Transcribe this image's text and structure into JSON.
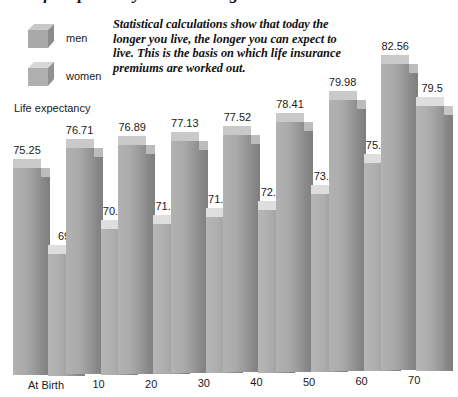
{
  "title": "Life expectancy at various ages",
  "caption": "Statistical calculations show that today the longer you live, the longer you can expect to live. This is the basis on which life insurance premiums are worked out.",
  "legend": {
    "items": [
      {
        "label": "men",
        "icon": "cube-icon",
        "color": "#a8a8a8"
      },
      {
        "label": "women",
        "icon": "cube-icon",
        "color": "#b0b0b0"
      }
    ],
    "caption": "Life expectancy"
  },
  "chart_data": {
    "type": "bar",
    "title": "Life expectancy at various ages",
    "xlabel": "",
    "ylabel": "Life expectancy",
    "ylim": [
      60,
      85
    ],
    "grid": false,
    "legend_position": "top-left",
    "categories": [
      "At Birth",
      "10",
      "20",
      "30",
      "40",
      "50",
      "60",
      "70"
    ],
    "series": [
      {
        "name": "men",
        "color": "#a8a8a8",
        "values": [
          75.25,
          76.71,
          76.89,
          77.13,
          77.52,
          78.41,
          79.98,
          82.56
        ]
      },
      {
        "name": "women",
        "color": "#b0b0b0",
        "values": [
          69,
          70.74,
          71.08,
          71.51,
          72.01,
          73.11,
          75.41,
          79.5
        ]
      }
    ],
    "value_labels": {
      "men": [
        "75.25",
        "76.71",
        "76.89",
        "77.13",
        "77.52",
        "78.41",
        "79.98",
        "82.56"
      ],
      "women": [
        "69",
        "70.74",
        "71.08",
        "71.51",
        "72.01",
        "73.11",
        "75.41",
        "79.5"
      ]
    },
    "annotation": "Statistical calculations show that today the longer you live, the longer you can expect to live. This is the basis on which life insurance premiums are worked out."
  }
}
